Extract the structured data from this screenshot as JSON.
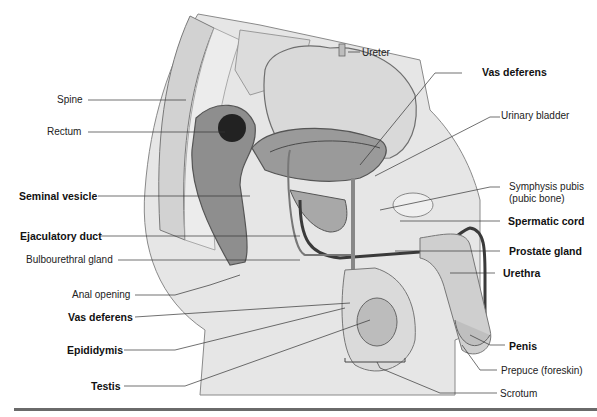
{
  "diagram": {
    "labels_left": [
      {
        "id": "spine",
        "text": "Spine",
        "bold": false
      },
      {
        "id": "rectum",
        "text": "Rectum",
        "bold": false
      },
      {
        "id": "seminal-vesicle",
        "text": "Seminal vesicle",
        "bold": true
      },
      {
        "id": "ejaculatory-duct",
        "text": "Ejaculatory duct",
        "bold": true
      },
      {
        "id": "bulbourethral-gland",
        "text": "Bulbourethral gland",
        "bold": false
      },
      {
        "id": "anal-opening",
        "text": "Anal opening",
        "bold": false
      },
      {
        "id": "vas-deferens-left",
        "text": "Vas deferens",
        "bold": true
      },
      {
        "id": "epididymis",
        "text": "Epididymis",
        "bold": true
      },
      {
        "id": "testis",
        "text": "Testis",
        "bold": true
      }
    ],
    "labels_right": [
      {
        "id": "ureter",
        "text": "Ureter",
        "bold": false
      },
      {
        "id": "vas-deferens-right",
        "text": "Vas deferens",
        "bold": true
      },
      {
        "id": "urinary-bladder",
        "text": "Urinary bladder",
        "bold": false
      },
      {
        "id": "symphysis-pubis",
        "text": "Symphysis pubis",
        "bold": false
      },
      {
        "id": "symphysis-pubis-sub",
        "text": "(pubic bone)",
        "bold": false
      },
      {
        "id": "spermatic-cord",
        "text": "Spermatic cord",
        "bold": true
      },
      {
        "id": "prostate-gland",
        "text": "Prostate gland",
        "bold": true
      },
      {
        "id": "urethra",
        "text": "Urethra",
        "bold": true
      },
      {
        "id": "penis",
        "text": "Penis",
        "bold": true
      },
      {
        "id": "prepuce",
        "text": "Prepuce (foreskin)",
        "bold": false
      },
      {
        "id": "scrotum",
        "text": "Scrotum",
        "bold": false
      }
    ]
  }
}
